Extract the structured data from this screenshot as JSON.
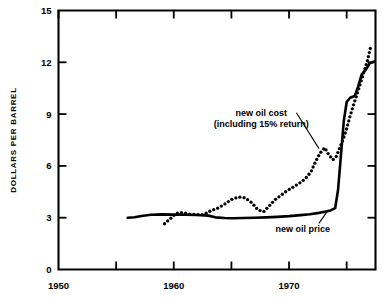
{
  "chart_data": {
    "type": "line",
    "title": "",
    "subtitle": "",
    "xlabel": "",
    "ylabel": "DOLLARS PER BARREL",
    "xlim": [
      1950,
      1977.5
    ],
    "ylim": [
      0,
      15
    ],
    "xticks": [
      1950,
      1955,
      1960,
      1965,
      1970,
      1975
    ],
    "xticklabels": [
      "1950",
      "",
      "1960",
      "",
      "1970",
      ""
    ],
    "yticks": [
      0,
      3,
      6,
      9,
      12,
      15
    ],
    "yticklabels": [
      "0",
      "3",
      "6",
      "9",
      "12",
      "15"
    ],
    "grid": false,
    "legend": "none",
    "annotations": [
      {
        "name": "new-oil-cost-label",
        "line1": "new oil cost",
        "line2": "(including 15% return)",
        "x": 1967.6,
        "y": 8.9,
        "leader_to": [
          1972.6,
          7.0
        ]
      },
      {
        "name": "new-oil-price-label",
        "line1": "new oil price",
        "line2": "",
        "x": 1971.2,
        "y": 2.15,
        "leader_to": [
          1973.3,
          3.35
        ]
      }
    ],
    "series": [
      {
        "name": "new oil price",
        "style": "solid",
        "color": "#000000",
        "points": [
          [
            1956.0,
            3.0
          ],
          [
            1956.6,
            3.03
          ],
          [
            1957.2,
            3.1
          ],
          [
            1958.0,
            3.17
          ],
          [
            1959.0,
            3.19
          ],
          [
            1960.0,
            3.18
          ],
          [
            1961.0,
            3.17
          ],
          [
            1962.0,
            3.16
          ],
          [
            1963.0,
            3.12
          ],
          [
            1963.6,
            3.02
          ],
          [
            1964.4,
            2.98
          ],
          [
            1965.2,
            2.97
          ],
          [
            1966.0,
            2.98
          ],
          [
            1967.0,
            3.0
          ],
          [
            1968.0,
            3.02
          ],
          [
            1969.0,
            3.05
          ],
          [
            1970.0,
            3.09
          ],
          [
            1971.0,
            3.15
          ],
          [
            1971.8,
            3.2
          ],
          [
            1972.6,
            3.28
          ],
          [
            1973.2,
            3.36
          ],
          [
            1973.6,
            3.42
          ],
          [
            1974.0,
            3.55
          ],
          [
            1974.25,
            4.6
          ],
          [
            1974.5,
            6.6
          ],
          [
            1974.75,
            8.6
          ],
          [
            1975.0,
            9.7
          ],
          [
            1975.3,
            9.95
          ],
          [
            1975.7,
            10.05
          ],
          [
            1976.0,
            10.6
          ],
          [
            1976.3,
            11.3
          ],
          [
            1976.7,
            11.6
          ],
          [
            1977.0,
            11.95
          ],
          [
            1977.4,
            12.05
          ]
        ]
      },
      {
        "name": "new oil cost (including 15% return)",
        "style": "dotted",
        "color": "#000000",
        "points": [
          [
            1959.2,
            2.65
          ],
          [
            1960.2,
            3.25
          ],
          [
            1960.8,
            3.3
          ],
          [
            1961.4,
            3.2
          ],
          [
            1962.0,
            3.18
          ],
          [
            1962.6,
            3.18
          ],
          [
            1963.2,
            3.4
          ],
          [
            1963.8,
            3.55
          ],
          [
            1964.4,
            3.78
          ],
          [
            1965.0,
            4.05
          ],
          [
            1965.6,
            4.2
          ],
          [
            1966.2,
            4.15
          ],
          [
            1966.8,
            3.85
          ],
          [
            1967.3,
            3.45
          ],
          [
            1967.8,
            3.35
          ],
          [
            1968.3,
            3.7
          ],
          [
            1968.8,
            4.05
          ],
          [
            1969.3,
            4.3
          ],
          [
            1969.8,
            4.55
          ],
          [
            1970.3,
            4.75
          ],
          [
            1970.9,
            5.0
          ],
          [
            1971.4,
            5.25
          ],
          [
            1971.9,
            5.65
          ],
          [
            1972.3,
            6.25
          ],
          [
            1972.7,
            6.75
          ],
          [
            1973.1,
            7.05
          ],
          [
            1973.4,
            6.7
          ],
          [
            1973.8,
            6.35
          ],
          [
            1974.1,
            6.55
          ],
          [
            1974.4,
            7.05
          ],
          [
            1974.7,
            7.55
          ],
          [
            1975.0,
            8.15
          ],
          [
            1975.3,
            8.9
          ],
          [
            1975.6,
            9.55
          ],
          [
            1975.9,
            10.15
          ],
          [
            1976.2,
            10.8
          ],
          [
            1976.5,
            11.45
          ],
          [
            1976.8,
            12.1
          ],
          [
            1977.05,
            12.8
          ]
        ]
      }
    ]
  }
}
